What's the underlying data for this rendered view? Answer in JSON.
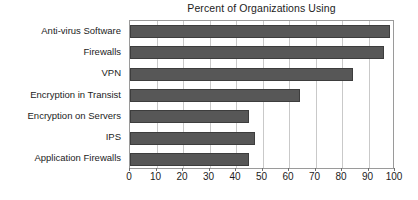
{
  "chart_data": {
    "type": "bar",
    "orientation": "horizontal",
    "title": "Percent of Organizations Using",
    "xlabel": "",
    "ylabel": "",
    "categories": [
      "Anti-virus Software",
      "Firewalls",
      "VPN",
      "Encryption in Transist",
      "Encryption on Servers",
      "IPS",
      "Application Firewalls"
    ],
    "values": [
      98,
      96,
      84,
      64,
      45,
      47,
      45
    ],
    "xlim": [
      0,
      100
    ],
    "xticks": [
      0,
      10,
      20,
      30,
      40,
      50,
      60,
      70,
      80,
      90,
      100
    ],
    "xtick_labels": [
      "0",
      "10",
      "20",
      "30",
      "40",
      "50",
      "60",
      "70",
      "80",
      "90",
      "100"
    ],
    "grid": "vertical",
    "legend": null,
    "bar_color": "#575757",
    "bar_edge_color": "#3d3d3d",
    "frame_color": "#9a9a9a",
    "gridline_color": "#c9c9c9",
    "background": "#ffffff",
    "text_color": "#1c1c1c"
  }
}
